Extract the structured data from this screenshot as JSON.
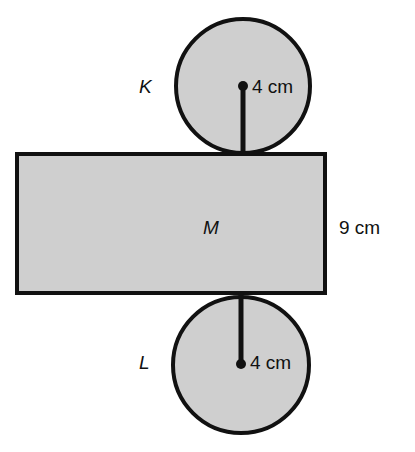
{
  "diagram": {
    "type": "cylinder net",
    "shapes": {
      "top_circle": {
        "label": "K",
        "radius_label": "4 cm"
      },
      "rectangle": {
        "label": "M",
        "height_label": "9 cm"
      },
      "bottom_circle": {
        "label": "L",
        "radius_label": "4 cm"
      }
    },
    "colors": {
      "fill": "#cfcfcf",
      "stroke": "#111111"
    }
  }
}
